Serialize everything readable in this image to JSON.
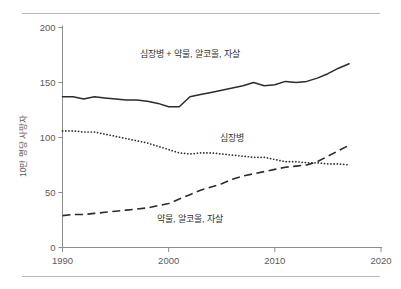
{
  "chart_data": {
    "type": "line",
    "title": "",
    "xlabel": "",
    "ylabel": "10만 명당 사망자",
    "xlim": [
      1990,
      2020
    ],
    "ylim": [
      0,
      200
    ],
    "xticks": [
      1990,
      2000,
      2010,
      2020
    ],
    "yticks": [
      0,
      50,
      100,
      150,
      200
    ],
    "grid": false,
    "legend_position": "inline-annotations",
    "x": [
      1990,
      1991,
      1992,
      1993,
      1994,
      1995,
      1996,
      1997,
      1998,
      1999,
      2000,
      2001,
      2002,
      2003,
      2004,
      2005,
      2006,
      2007,
      2008,
      2009,
      2010,
      2011,
      2012,
      2013,
      2014,
      2015,
      2016,
      2017
    ],
    "series": [
      {
        "name": "심장병 + 약물, 알코올, 자살",
        "style": "solid",
        "label_x": 2002,
        "label_y": 176,
        "values": [
          137,
          137,
          135,
          137,
          136,
          135,
          134,
          134,
          133,
          131,
          128,
          128,
          137,
          139,
          141,
          143,
          145,
          147,
          150,
          147,
          148,
          151,
          150,
          151,
          154,
          158,
          163,
          167
        ]
      },
      {
        "name": "심장병",
        "style": "dotted",
        "label_x": 2006,
        "label_y": 100,
        "values": [
          106,
          106,
          105,
          105,
          103,
          101,
          99,
          97,
          95,
          92,
          89,
          86,
          85,
          86,
          86,
          85,
          84,
          83,
          82,
          82,
          80,
          78,
          78,
          77,
          77,
          76,
          76,
          75
        ]
      },
      {
        "name": "약물, 알코올, 자살",
        "style": "dashed",
        "label_x": 2002,
        "label_y": 26,
        "values": [
          29,
          30,
          30,
          31,
          32,
          33,
          34,
          35,
          36,
          38,
          40,
          44,
          48,
          52,
          55,
          58,
          62,
          65,
          67,
          69,
          71,
          73,
          74,
          75,
          78,
          83,
          88,
          93
        ]
      }
    ]
  }
}
